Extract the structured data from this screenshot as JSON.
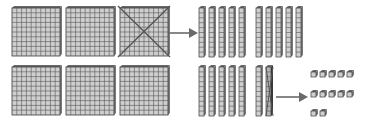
{
  "diagram": {
    "colors": {
      "block_fill": "#cfcfcf",
      "grid_line": "#555555",
      "block_edge": "#3a3a3a",
      "block_top": "#6a6a6a",
      "block_side": "#7a7a7a",
      "cross_line": "#555555",
      "arrow": "#6a6a6a",
      "background": "#ffffff"
    },
    "top_row": {
      "label": "3 hundreds flats, one regrouped into 10 tens rods",
      "flats": [
        {
          "x": 12,
          "y": 8,
          "size": 48,
          "crossed": false
        },
        {
          "x": 66,
          "y": 8,
          "size": 48,
          "crossed": false
        },
        {
          "x": 120,
          "y": 8,
          "size": 48,
          "crossed": true
        }
      ],
      "arrow": {
        "x1": 169,
        "y1": 33,
        "x2": 198,
        "y2": 33
      },
      "rods": [
        {
          "x": 199,
          "y": 8,
          "crossed": false
        },
        {
          "x": 209,
          "y": 8,
          "crossed": false
        },
        {
          "x": 219,
          "y": 8,
          "crossed": false
        },
        {
          "x": 229,
          "y": 8,
          "crossed": false
        },
        {
          "x": 239,
          "y": 8,
          "crossed": false
        },
        {
          "x": 256,
          "y": 8,
          "crossed": false
        },
        {
          "x": 266,
          "y": 8,
          "crossed": false
        },
        {
          "x": 276,
          "y": 8,
          "crossed": false
        },
        {
          "x": 286,
          "y": 8,
          "crossed": false
        },
        {
          "x": 296,
          "y": 8,
          "crossed": false
        }
      ]
    },
    "bottom_row": {
      "label": "3 hundreds flats, 7 tens rods, one rod regrouped into 10 ones",
      "flats": [
        {
          "x": 12,
          "y": 67,
          "size": 48,
          "crossed": false
        },
        {
          "x": 66,
          "y": 67,
          "size": 48,
          "crossed": false
        },
        {
          "x": 120,
          "y": 67,
          "size": 48,
          "crossed": false
        }
      ],
      "rods": [
        {
          "x": 199,
          "y": 67,
          "crossed": false
        },
        {
          "x": 209,
          "y": 67,
          "crossed": false
        },
        {
          "x": 219,
          "y": 67,
          "crossed": false
        },
        {
          "x": 229,
          "y": 67,
          "crossed": false
        },
        {
          "x": 239,
          "y": 67,
          "crossed": false
        },
        {
          "x": 256,
          "y": 67,
          "crossed": false
        },
        {
          "x": 266,
          "y": 67,
          "crossed": true
        }
      ],
      "arrow": {
        "x1": 276,
        "y1": 97,
        "x2": 308,
        "y2": 97
      },
      "units": [
        {
          "x": 311,
          "y": 72
        },
        {
          "x": 320,
          "y": 72
        },
        {
          "x": 329,
          "y": 72
        },
        {
          "x": 338,
          "y": 72
        },
        {
          "x": 347,
          "y": 72
        },
        {
          "x": 311,
          "y": 92
        },
        {
          "x": 320,
          "y": 92
        },
        {
          "x": 329,
          "y": 92
        },
        {
          "x": 338,
          "y": 92
        },
        {
          "x": 347,
          "y": 92
        },
        {
          "x": 311,
          "y": 111
        },
        {
          "x": 320,
          "y": 111
        }
      ]
    },
    "counts": {
      "top_flats": 3,
      "top_rods": 10,
      "bottom_flats": 3,
      "bottom_rods": 7,
      "bottom_units": 12
    }
  }
}
